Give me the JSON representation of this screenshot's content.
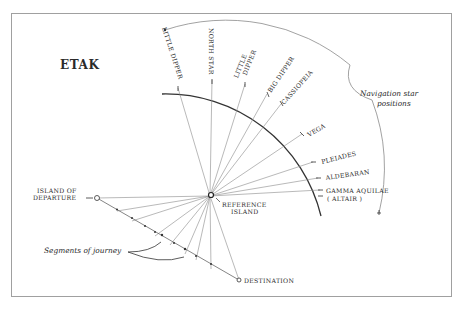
{
  "title": "ETAK",
  "reference_island": "REFERENCE ISLAND",
  "reference_island_lines": [
    "REFERENCE",
    "ISLAND"
  ],
  "departure": {
    "label": "ISLAND OF DEPARTURE",
    "lines": [
      "ISLAND OF",
      "DEPARTURE"
    ]
  },
  "destination": {
    "label": "DESTINATION"
  },
  "segments_label": "Segments of journey",
  "navigation_label": {
    "text": "Navigation star positions",
    "lines": [
      "Navigation star",
      "positions"
    ]
  },
  "stars": [
    {
      "name": "LITTLE DIPPER",
      "position": "setting"
    },
    {
      "name": "NORTH STAR"
    },
    {
      "name": "LITTLE DIPPER",
      "lines": [
        "LITTLE",
        "DIPPER"
      ]
    },
    {
      "name": "BIG DIPPER"
    },
    {
      "name": "CASSIOPEIA",
      "displayed": "CASSIOPEIA"
    },
    {
      "name": "VEGA"
    },
    {
      "name": "PLEIADES"
    },
    {
      "name": "ALDEBARAN"
    },
    {
      "name": "GAMMA AQUILAE (ALTAIR)",
      "lines": [
        "GAMMA AQUILAE",
        "( ALTAIR )"
      ]
    }
  ],
  "colors": {
    "ink": "#2a2a2a",
    "line": "#8a8a8a",
    "frame": "#9a9a9a",
    "background": "#ffffff"
  }
}
